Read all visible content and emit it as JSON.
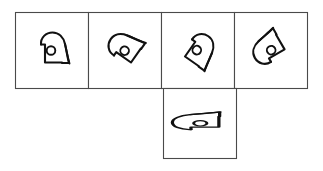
{
  "canvas": {
    "width": 323,
    "height": 171,
    "background_color": "#ffffff",
    "stroke_color": "#111111",
    "border_color": "#4a4a4a"
  },
  "layout": {
    "description": "T-shaped arrangement: a row of four square panels with a fifth panel below the third panel",
    "top_row": {
      "x": 15,
      "y": 12,
      "cell_width": 73,
      "cell_height": 76,
      "count": 4
    },
    "bottom_panel": {
      "x": 163,
      "y": 88,
      "width": 73,
      "height": 70
    }
  },
  "panels": [
    {
      "id": "panel-1",
      "position": "top-row-1",
      "figure_name": "blob-with-circle",
      "orientation_label": "upright",
      "rotation_degrees": 0,
      "has_circle_marker": true,
      "has_tail": true
    },
    {
      "id": "panel-2",
      "position": "top-row-2",
      "figure_name": "blob-with-circle",
      "orientation_label": "rotated-left",
      "rotation_degrees": -55,
      "has_circle_marker": true,
      "has_tail": true
    },
    {
      "id": "panel-3",
      "position": "top-row-3",
      "figure_name": "blob-with-circle",
      "orientation_label": "rotated-right",
      "rotation_degrees": 35,
      "has_circle_marker": true,
      "has_tail": true
    },
    {
      "id": "panel-4",
      "position": "top-row-4",
      "figure_name": "blob-with-circle",
      "orientation_label": "rotated-down-left",
      "rotation_degrees": -120,
      "has_circle_marker": true,
      "has_tail": true
    },
    {
      "id": "panel-5",
      "position": "bottom-center",
      "figure_name": "blob-stretched-horizontal",
      "orientation_label": "stretched-sideways",
      "rotation_degrees": -90,
      "has_circle_marker": true,
      "has_tail": true,
      "note": "horizontally elongated variant with splayed tail prongs"
    }
  ],
  "accessibility": {
    "alt_text": "Five bordered panels each containing a hand-drawn rounded blob outline with a small circle inside; four across the top and one below the third."
  }
}
